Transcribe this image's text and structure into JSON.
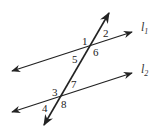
{
  "diagram": {
    "lines": {
      "l1": {
        "name": "l",
        "subscript": "1"
      },
      "l2": {
        "name": "l",
        "subscript": "2"
      }
    },
    "angles": {
      "a1": "1",
      "a2": "2",
      "a5": "5",
      "a6": "6",
      "a3": "3",
      "a7": "7",
      "a4": "4",
      "a8": "8"
    },
    "colors": {
      "line": "#222222",
      "background": "#ffffff"
    }
  }
}
